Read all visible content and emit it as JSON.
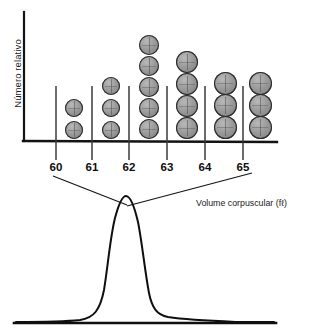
{
  "chart_data": {
    "type": "bar",
    "title": "",
    "subtitle": "",
    "xlabel": "Volume corpuscular (fℓ)",
    "ylabel": "Número relativo",
    "categories": [
      "60",
      "61",
      "62",
      "63",
      "64",
      "65"
    ],
    "tick_labels": [
      "60",
      "61",
      "62",
      "63",
      "64",
      "65"
    ],
    "values": [
      2,
      3,
      5,
      4,
      3,
      3
    ],
    "value_unit": "cells (stacked dot count)",
    "xlim": [
      59.5,
      65.5
    ],
    "ylim": [
      0,
      6
    ],
    "grid": false,
    "legend": null,
    "columns": [
      {
        "label": "60",
        "count": 2
      },
      {
        "label": "61",
        "count": 3
      },
      {
        "label": "62",
        "count": 5
      },
      {
        "label": "63",
        "count": 4
      },
      {
        "label": "64",
        "count": 3
      },
      {
        "label": "65",
        "count": 3
      }
    ],
    "secondary_plot": {
      "type": "line",
      "description": "Smoothed unimodal distribution curve with a sharp peak and long right-hand tail, drawn below the histogram and connected to it by two leader lines.",
      "peak_x": 124,
      "tail": "right"
    }
  },
  "axes": {
    "ylabel": "Número relativo",
    "xtitle": "Volume corpuscular (fℓ)"
  },
  "ticks": [
    {
      "label": "60",
      "x": 56
    },
    {
      "label": "61",
      "x": 92
    },
    {
      "label": "62",
      "x": 129
    },
    {
      "label": "63",
      "x": 167
    },
    {
      "label": "64",
      "x": 205
    },
    {
      "label": "65",
      "x": 243
    }
  ]
}
